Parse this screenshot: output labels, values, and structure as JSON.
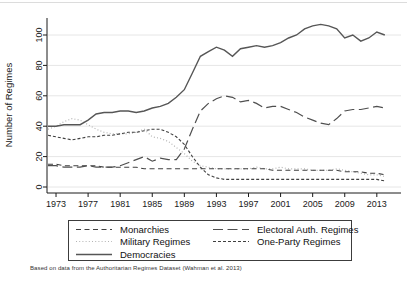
{
  "figure": {
    "y_axis_title": "Number of Regimes",
    "caption": "Based on data from the Authoritarian Regimes Dataset (Wahman et al. 2013)"
  },
  "colors": {
    "axis": "#1a1a1a",
    "grid": "#e6e6e6",
    "tick_text": "#1a1a1a",
    "top_rule": "#dcdcdc"
  },
  "chart_data": {
    "type": "line",
    "title": "",
    "xlabel": "",
    "ylabel": "Number of Regimes",
    "xlim": [
      1972,
      2015
    ],
    "ylim": [
      0,
      110
    ],
    "x_start_year": 1972,
    "x_ticks": [
      1973,
      1977,
      1981,
      1985,
      1989,
      1993,
      1997,
      2001,
      2005,
      2009,
      2013
    ],
    "y_ticks": [
      0,
      20,
      40,
      60,
      80,
      100
    ],
    "grid": "horizontal",
    "legend_position": "bottom",
    "series": [
      {
        "name": "Monarchies",
        "style": "medium-dash",
        "dash": "5,3.5",
        "color": "#404040",
        "width": 1.1,
        "values": [
          15,
          15,
          14,
          14,
          14,
          14,
          14,
          13,
          13,
          13,
          13,
          13,
          12,
          12,
          12,
          12,
          12,
          12,
          12,
          12,
          12,
          12,
          12,
          12,
          12,
          12,
          12,
          12,
          11,
          11,
          11,
          11,
          11,
          11,
          11,
          11,
          11,
          10,
          10,
          10,
          9,
          9,
          8
        ]
      },
      {
        "name": "Military Regimes",
        "style": "dotted",
        "dash": "1,2.2",
        "color": "#b4b4b4",
        "width": 1.2,
        "values": [
          38,
          40,
          43,
          45,
          44,
          41,
          38,
          36,
          35,
          35,
          35,
          36,
          38,
          33,
          32,
          30,
          26,
          22,
          17,
          14,
          13,
          12,
          12,
          12,
          12,
          12,
          13,
          12,
          12,
          13,
          12,
          12,
          12,
          11,
          11,
          11,
          12,
          11,
          10,
          9,
          8,
          8,
          7
        ]
      },
      {
        "name": "Democracies",
        "style": "solid",
        "dash": "",
        "color": "#565656",
        "width": 1.4,
        "values": [
          40,
          40,
          41,
          41,
          41,
          44,
          48,
          49,
          49,
          50,
          50,
          49,
          50,
          52,
          53,
          55,
          59,
          64,
          75,
          86,
          89,
          92,
          90,
          86,
          91,
          92,
          93,
          92,
          93,
          95,
          98,
          100,
          104,
          106,
          107,
          106,
          104,
          98,
          100,
          96,
          98,
          102,
          100
        ]
      },
      {
        "name": "Electoral Auth. Regimes",
        "style": "long-dash",
        "dash": "10,4.5",
        "color": "#4f4f4f",
        "width": 1.2,
        "values": [
          14,
          14,
          13,
          13,
          13,
          14,
          13,
          13,
          13,
          14,
          16,
          18,
          20,
          17,
          19,
          18,
          18,
          25,
          38,
          50,
          55,
          58,
          60,
          59,
          56,
          57,
          55,
          52,
          53,
          53,
          51,
          49,
          46,
          44,
          42,
          41,
          45,
          50,
          51,
          51,
          52,
          53,
          52
        ]
      },
      {
        "name": "One-Party Regimes",
        "style": "short-dash",
        "dash": "3,2",
        "color": "#404040",
        "width": 1.1,
        "values": [
          34,
          33,
          32,
          31,
          32,
          33,
          33,
          34,
          34,
          35,
          36,
          36,
          37,
          38,
          38,
          36,
          33,
          28,
          20,
          13,
          8,
          6,
          5,
          5,
          5,
          5,
          5,
          5,
          5,
          5,
          5,
          5,
          5,
          5,
          5,
          5,
          5,
          5,
          5,
          5,
          5,
          5,
          4
        ]
      }
    ]
  }
}
